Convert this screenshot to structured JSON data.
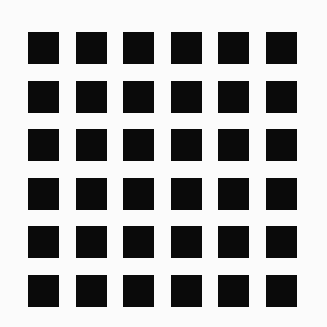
{
  "figure": {
    "background_color": "#fbfbfb",
    "square_color": "#0a0a0a",
    "rows": 6,
    "cols": 6,
    "square_width": 31,
    "square_height": 32,
    "origin_x": 28,
    "origin_y": 32,
    "col_pitch": 47.6,
    "row_pitch": 48.6
  }
}
